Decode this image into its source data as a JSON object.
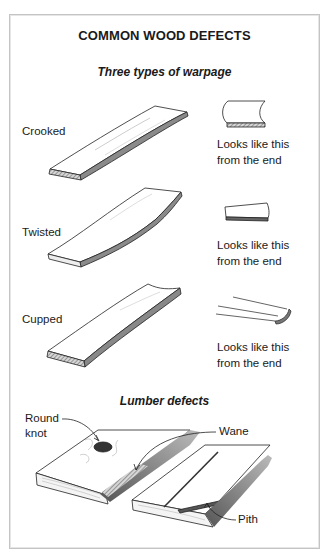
{
  "title": "COMMON WOOD DEFECTS",
  "warpage": {
    "heading": "Three types of warpage",
    "types": [
      {
        "name": "Crooked",
        "caption_line1": "Looks like this",
        "caption_line2": "from the end"
      },
      {
        "name": "Twisted",
        "caption_line1": "Looks like this",
        "caption_line2": "from the end"
      },
      {
        "name": "Cupped",
        "caption_line1": "Looks like this",
        "caption_line2": "from the end"
      }
    ]
  },
  "lumber": {
    "heading": "Lumber defects",
    "callouts": {
      "knot_line1": "Round",
      "knot_line2": "knot",
      "wane": "Wane",
      "pith": "Pith"
    }
  },
  "colors": {
    "frame": "#c4c4c4",
    "ink": "#1a1a1a",
    "shade": "#6e6e6e"
  }
}
